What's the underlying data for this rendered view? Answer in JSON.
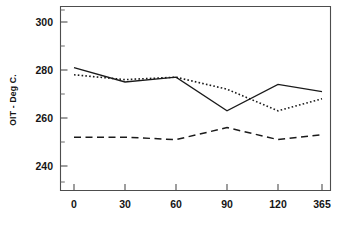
{
  "chart_data": {
    "type": "line",
    "title": "",
    "subtitle": "",
    "xlabel": "",
    "ylabel": "OIT - Deg C.",
    "categories": [
      "0",
      "30",
      "60",
      "90",
      "120",
      "365"
    ],
    "x": [
      0,
      30,
      60,
      90,
      120,
      365
    ],
    "xlim": [
      0,
      5
    ],
    "ylim": [
      230,
      305
    ],
    "ytick_labels": [
      "240",
      "260",
      "280",
      "300"
    ],
    "ytick_values": [
      240,
      260,
      280,
      300
    ],
    "y_minor_tick_values": [
      235,
      245,
      250,
      255,
      265,
      270,
      275,
      285,
      290,
      295,
      300,
      305
    ],
    "grid": false,
    "legend": null,
    "legend_position": "none",
    "frame": "box",
    "series": [
      {
        "name": "solid-series",
        "style": "solid",
        "color": "#1a1a1a",
        "values": [
          281,
          275,
          277,
          263,
          274,
          271
        ]
      },
      {
        "name": "dotted-series",
        "style": "dotted",
        "color": "#1a1a1a",
        "values": [
          278,
          276,
          277,
          272,
          263,
          268
        ]
      },
      {
        "name": "dashed-series",
        "style": "dashed",
        "color": "#1a1a1a",
        "values": [
          252,
          252,
          251,
          256,
          251,
          253
        ]
      }
    ]
  },
  "axes": {
    "y_axis_label": "OIT - Deg C.",
    "y_tick_labels": [
      "300",
      "280",
      "260",
      "240"
    ],
    "x_tick_labels": [
      "0",
      "30",
      "60",
      "90",
      "120",
      "365"
    ]
  }
}
